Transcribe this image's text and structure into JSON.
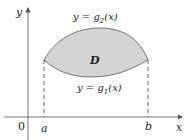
{
  "diagram": {
    "axes": {
      "x_label": "x",
      "y_label": "y",
      "origin_label": "0"
    },
    "region_label": "D",
    "upper_curve": {
      "prefix": "y = ",
      "func": "g",
      "sub": "2",
      "arg": "(x)"
    },
    "lower_curve": {
      "prefix": "y = ",
      "func": "g",
      "sub": "1",
      "arg": "(x)"
    },
    "bounds": {
      "left": "a",
      "right": "b"
    },
    "colors": {
      "region_fill": "#d4d4d4",
      "stroke": "#555555"
    }
  }
}
